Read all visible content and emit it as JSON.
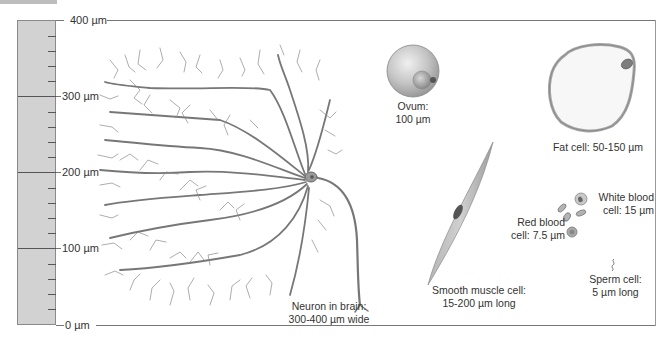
{
  "scale": {
    "unit": "µm",
    "labels": [
      "400 µm",
      "300 µm",
      "200 µm",
      "100 µm",
      "0 µm"
    ],
    "values": [
      400,
      300,
      200,
      100,
      0
    ],
    "minor_ticks_per_100": 4
  },
  "cells": [
    {
      "id": "neuron",
      "line1": "Neuron in brain:",
      "line2": "300-400 µm wide"
    },
    {
      "id": "ovum",
      "line1": "Ovum:",
      "line2": "100 µm"
    },
    {
      "id": "fat",
      "line1": "Fat cell: 50-150 µm",
      "line2": ""
    },
    {
      "id": "smooth-muscle",
      "line1": "Smooth muscle cell:",
      "line2": "15-200 µm long"
    },
    {
      "id": "red-blood",
      "line1": "Red blood",
      "line2": "cell: 7.5 µm"
    },
    {
      "id": "white-blood",
      "line1": "White blood",
      "line2": "cell: 15 µm"
    },
    {
      "id": "sperm",
      "line1": "Sperm cell:",
      "line2": "5 µm long"
    }
  ],
  "colors": {
    "scalebar_fill": "#d2d2d2",
    "cell_gray": "#a8a8a8",
    "line": "#777777"
  }
}
